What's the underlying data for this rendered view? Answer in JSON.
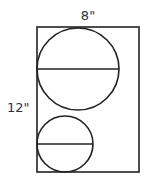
{
  "diagram": {
    "width_label": "8\"",
    "height_label": "12\"",
    "stroke_color": "#222222",
    "rectangle": {
      "x": 37,
      "y": 27,
      "width": 102,
      "height": 145
    },
    "circles": [
      {
        "name": "large-circle",
        "cx": 78,
        "cy": 69,
        "r": 41,
        "diameter_y": 69
      },
      {
        "name": "small-circle",
        "cx": 65,
        "cy": 144,
        "r": 28,
        "diameter_y": 144
      }
    ]
  }
}
